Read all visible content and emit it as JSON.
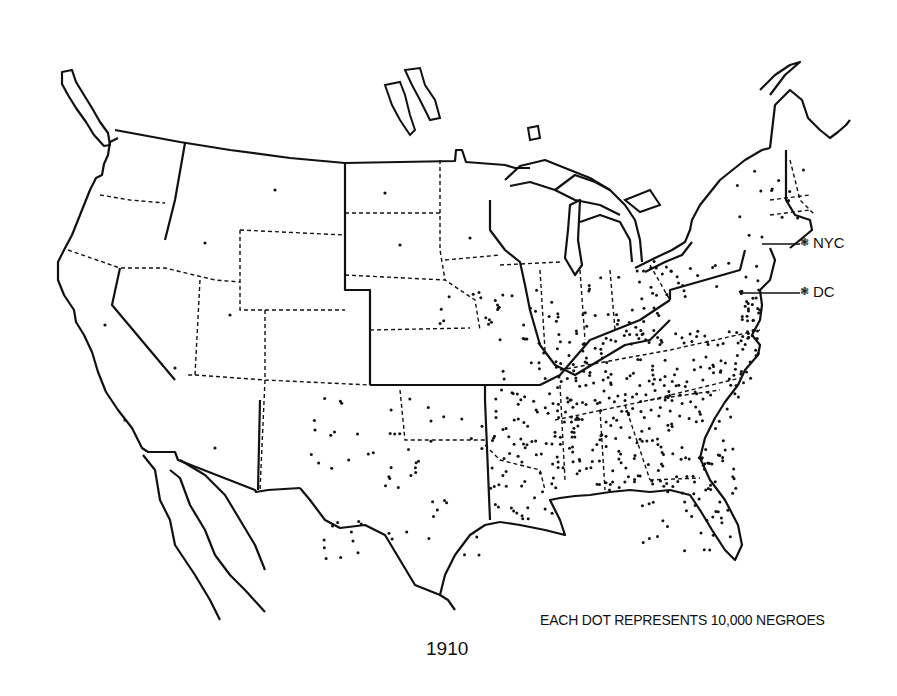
{
  "map": {
    "title": "1910",
    "legend": "EACH DOT REPRESENTS 10,000 NEGROES",
    "dot_value": 10000,
    "line_color": "#111111",
    "background": "#ffffff",
    "cities": [
      {
        "label": "NYC",
        "glyph": "❃"
      },
      {
        "label": "DC",
        "glyph": "❃"
      }
    ]
  }
}
